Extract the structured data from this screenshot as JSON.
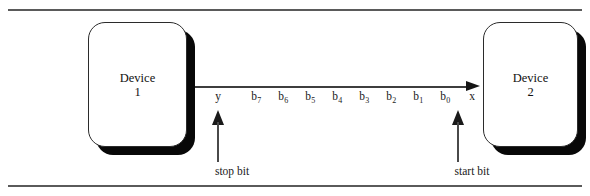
{
  "diagram": {
    "background_color": "#ffffff",
    "line_color": "#3d3d3d",
    "shadow_color": "#080808",
    "rule_color": "#5a5a5a"
  },
  "devices": [
    {
      "name": "Device",
      "index": "1"
    },
    {
      "name": "Device",
      "index": "2"
    }
  ],
  "frame": {
    "labels": [
      {
        "text": "y",
        "sub": "",
        "x": 218
      },
      {
        "text": "b",
        "sub": "7",
        "x": 256
      },
      {
        "text": "b",
        "sub": "6",
        "x": 283
      },
      {
        "text": "b",
        "sub": "5",
        "x": 310
      },
      {
        "text": "b",
        "sub": "4",
        "x": 337
      },
      {
        "text": "b",
        "sub": "3",
        "x": 364
      },
      {
        "text": "b",
        "sub": "2",
        "x": 391
      },
      {
        "text": "b",
        "sub": "1",
        "x": 418
      },
      {
        "text": "b",
        "sub": "0",
        "x": 445
      },
      {
        "text": "x",
        "sub": "",
        "x": 472
      }
    ]
  },
  "callouts": {
    "stop_bit": "stop bit",
    "start_bit": "start bit"
  }
}
